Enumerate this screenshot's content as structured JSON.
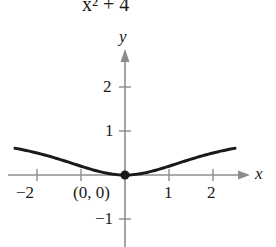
{
  "header_fragment": {
    "text": "x² + 4"
  },
  "axes": {
    "x_label": "x",
    "y_label": "y",
    "x_ticks": [
      {
        "value": -2,
        "label": "−2"
      },
      {
        "value": -1,
        "label": ""
      },
      {
        "value": 1,
        "label": "1"
      },
      {
        "value": 2,
        "label": "2"
      }
    ],
    "y_ticks": [
      {
        "value": 2,
        "label": "2"
      },
      {
        "value": 1,
        "label": "1"
      },
      {
        "value": -1,
        "label": "−1"
      }
    ]
  },
  "point": {
    "label": "(0, 0)",
    "x": 0,
    "y": 0
  },
  "curve": {
    "function": "y = x² / (x² + 4)",
    "x_range": [
      -2.5,
      2.5
    ]
  },
  "colors": {
    "curve": "#1a1a1a",
    "axis": "#8c8c8c",
    "text": "#1a1a1a"
  }
}
